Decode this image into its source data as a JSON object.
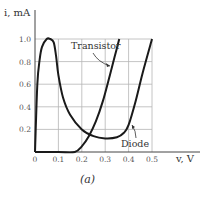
{
  "chart_data": {
    "type": "line",
    "title": "",
    "caption": "(a)",
    "xlabel": "v, V",
    "ylabel": "i, mA",
    "xlim": [
      0,
      0.5
    ],
    "ylim": [
      0,
      1.0
    ],
    "grid": true,
    "x_ticks": [
      "0",
      "0.1",
      "0.2",
      "0.3",
      "0.4",
      "0.5"
    ],
    "y_ticks": [
      "0.2",
      "0.4",
      "0.6",
      "0.8",
      "1.0"
    ],
    "legend_position": "inline annotations",
    "series": [
      {
        "name": "Diode",
        "x": [
          0,
          0.01,
          0.02,
          0.03,
          0.05,
          0.065,
          0.08,
          0.09,
          0.1,
          0.12,
          0.15,
          0.2,
          0.25,
          0.3,
          0.35,
          0.38,
          0.4,
          0.43,
          0.46,
          0.5
        ],
        "y": [
          0,
          0.6,
          0.82,
          0.93,
          1.0,
          1.0,
          0.97,
          0.85,
          0.68,
          0.48,
          0.33,
          0.2,
          0.14,
          0.12,
          0.13,
          0.17,
          0.24,
          0.45,
          0.7,
          1.0
        ]
      },
      {
        "name": "Transistor",
        "x": [
          0,
          0.1,
          0.17,
          0.2,
          0.23,
          0.26,
          0.29,
          0.32,
          0.34,
          0.36
        ],
        "y": [
          0,
          0,
          0,
          0.05,
          0.14,
          0.27,
          0.45,
          0.68,
          0.84,
          1.0
        ]
      }
    ],
    "annotations": [
      {
        "text": "Transistor",
        "points_to": [
          0.32,
          0.7
        ]
      },
      {
        "text": "Diode",
        "points_to": [
          0.41,
          0.3
        ]
      }
    ]
  }
}
